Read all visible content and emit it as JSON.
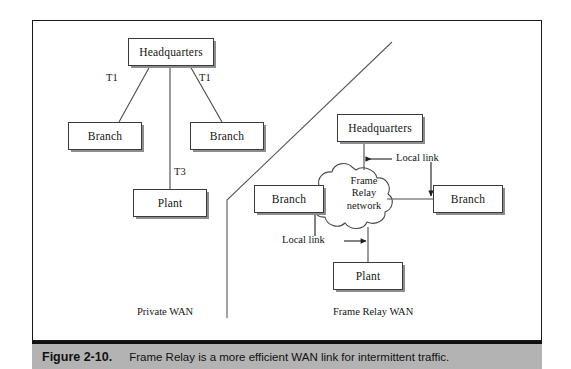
{
  "figure": {
    "caption_number": "Figure 2-10.",
    "caption_text": "Frame Relay is a more efficient WAN link for intermittent traffic.",
    "caption_bar_color": "#b3b3b3",
    "frame_border_color": "#1a1a1a",
    "background_color": "#ffffff"
  },
  "sections": {
    "left_label": "Private WAN",
    "right_label": "Frame Relay WAN"
  },
  "private_wan": {
    "nodes": [
      {
        "id": "hq",
        "label": "Headquarters"
      },
      {
        "id": "branch_left",
        "label": "Branch"
      },
      {
        "id": "branch_right",
        "label": "Branch"
      },
      {
        "id": "plant",
        "label": "Plant"
      }
    ],
    "links": [
      {
        "from": "hq",
        "to": "branch_left",
        "label": "T1"
      },
      {
        "from": "hq",
        "to": "branch_right",
        "label": "T1"
      },
      {
        "from": "hq",
        "to": "plant",
        "label": "T3"
      }
    ]
  },
  "frame_relay_wan": {
    "cloud": {
      "label_line1": "Frame",
      "label_line2": "Relay",
      "label_line3": "network"
    },
    "nodes": [
      {
        "id": "fr_hq",
        "label": "Headquarters"
      },
      {
        "id": "fr_branch_left",
        "label": "Branch"
      },
      {
        "id": "fr_branch_right",
        "label": "Branch"
      },
      {
        "id": "fr_plant",
        "label": "Plant"
      }
    ],
    "annotations": [
      {
        "id": "local_link_upper",
        "label": "Local link"
      },
      {
        "id": "local_link_lower",
        "label": "Local link"
      }
    ]
  }
}
